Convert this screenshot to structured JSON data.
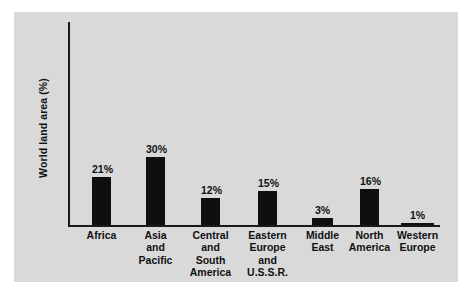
{
  "chart_data": {
    "type": "bar",
    "title": "",
    "xlabel": "",
    "ylabel": "World land area (%)",
    "ylim": [
      0,
      32
    ],
    "grid": false,
    "legend": null,
    "value_suffix": "%",
    "categories": [
      "Africa",
      "Asia and Pacific",
      "Central and South America",
      "Eastern Europe and U.S.S.R.",
      "Middle East",
      "North America",
      "Western Europe"
    ],
    "values": [
      21,
      30,
      12,
      15,
      3,
      16,
      1
    ],
    "bars": [
      {
        "category": "Africa",
        "label_lines": [
          "Africa"
        ],
        "value": 21,
        "value_label": "21%",
        "left": 22,
        "width": 19
      },
      {
        "category": "Asia and Pacific",
        "label_lines": [
          "Asia",
          "and",
          "Pacific"
        ],
        "value": 30,
        "value_label": "30%",
        "left": 76,
        "width": 19
      },
      {
        "category": "Central and South America",
        "label_lines": [
          "Central",
          "and",
          "South",
          "America"
        ],
        "value": 12,
        "value_label": "12%",
        "left": 131,
        "width": 19
      },
      {
        "category": "Eastern Europe and U.S.S.R.",
        "label_lines": [
          "Eastern",
          "Europe",
          "and",
          "U.S.S.R."
        ],
        "value": 15,
        "value_label": "15%",
        "left": 188,
        "width": 19
      },
      {
        "category": "Middle East",
        "label_lines": [
          "Middle",
          "East"
        ],
        "value": 3,
        "value_label": "3%",
        "left": 242,
        "width": 21
      },
      {
        "category": "North America",
        "label_lines": [
          "North",
          "America"
        ],
        "value": 16,
        "value_label": "16%",
        "left": 290,
        "width": 19
      },
      {
        "category": "Western Europe",
        "label_lines": [
          "Western",
          "Europe"
        ],
        "value": 1,
        "value_label": "1%",
        "left": 331,
        "width": 33
      }
    ],
    "colors": {
      "bar": "#100f0f",
      "axis": "#1a1a1a",
      "panel_background": "#d9d9d9",
      "page_background": "#ffffff",
      "text": "#111111"
    }
  }
}
